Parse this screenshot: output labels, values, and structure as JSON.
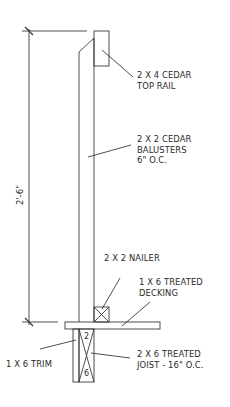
{
  "drawing": {
    "dimension": {
      "label": "2'-6\""
    },
    "callouts": {
      "top_rail": {
        "line1": "2 X 4 CEDAR",
        "line2": "TOP RAIL"
      },
      "balusters": {
        "line1": "2 X 2 CEDAR",
        "line2": "BALUSTERS",
        "line3": "6\" O.C."
      },
      "nailer": {
        "line1": "2 X 2 NAILER"
      },
      "decking": {
        "line1": "1 X 6 TREATED",
        "line2": "DECKING"
      },
      "trim": {
        "line1": "1 X 6 TRIM"
      },
      "joist": {
        "line1": "2 X 6 TREATED",
        "line2": "JOIST - 16\" O.C."
      }
    },
    "joist_marks": {
      "top": "2",
      "bottom": "6"
    },
    "colors": {
      "line": "#3a3a3a",
      "text": "#2a2a2a",
      "background": "#ffffff"
    }
  }
}
